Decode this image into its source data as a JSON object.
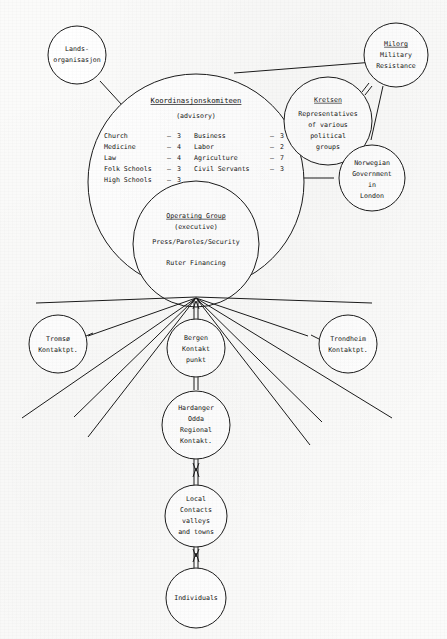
{
  "diagram": {
    "nodes": {
      "landsorganisasjon": {
        "lines": [
          "Lands-",
          "organisasjon"
        ]
      },
      "milorg": {
        "lines": [
          "Milorg",
          "Military",
          "Resistance"
        ],
        "underline_first": true
      },
      "kretsen": {
        "lines": [
          "Kretsen",
          "Representatives",
          "of various",
          "political",
          "groups"
        ],
        "underline_first": true
      },
      "norwegian_government": {
        "lines": [
          "Norwegian",
          "Government",
          "in",
          "London"
        ]
      },
      "koordinasjonskomiteen": {
        "title": "Koordinasjonskomiteen",
        "subtitle": "(advisory)",
        "members_left": [
          {
            "label": "Church",
            "count": "3"
          },
          {
            "label": "Medicine",
            "count": "4"
          },
          {
            "label": "Law",
            "count": "4"
          },
          {
            "label": "Folk Schools",
            "count": "3"
          },
          {
            "label": "High Schools",
            "count": "3"
          }
        ],
        "members_right": [
          {
            "label": "Business",
            "count": "3"
          },
          {
            "label": "Labor",
            "count": "2"
          },
          {
            "label": "Agriculture",
            "count": "7"
          },
          {
            "label": "Civil Servants",
            "count": "3"
          }
        ]
      },
      "operating_group": {
        "title": "Operating Group",
        "subtitle": "(executive)",
        "line3": "Press/Paroles/Security",
        "line4": "Ruter Financing"
      },
      "tromso": {
        "lines": [
          "Tromsø",
          "Kontaktpt."
        ]
      },
      "bergen": {
        "lines": [
          "Bergen",
          "Kontakt",
          "punkt"
        ]
      },
      "trondheim": {
        "lines": [
          "Trondheim",
          "Kontaktpt."
        ]
      },
      "hardanger": {
        "lines": [
          "Hardanger",
          "Odda",
          "Regional",
          "Kontakt."
        ]
      },
      "local_contacts": {
        "lines": [
          "Local",
          "Contacts",
          "valleys",
          "and towns"
        ]
      },
      "individuals": {
        "lines": [
          "Individuals"
        ]
      }
    },
    "colors": {
      "ink": "#1b1b1b",
      "paper": "#fbfbfa"
    }
  }
}
